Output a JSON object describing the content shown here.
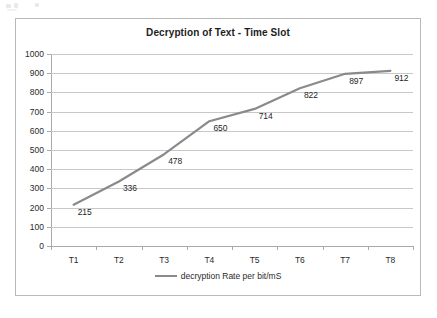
{
  "chart_data": {
    "type": "line",
    "title": "Decryption of Text - Time Slot",
    "xlabel": "",
    "ylabel": "",
    "categories": [
      "T1",
      "T2",
      "T3",
      "T4",
      "T5",
      "T6",
      "T7",
      "T8"
    ],
    "series": [
      {
        "name": "decryption Rate per bit/mS",
        "values": [
          215,
          336,
          478,
          650,
          714,
          822,
          897,
          912
        ]
      }
    ],
    "data_labels": [
      "215",
      "336",
      "478",
      "650",
      "714",
      "822",
      "897",
      "912"
    ],
    "ylim": [
      0,
      1000
    ],
    "y_ticks": [
      0,
      100,
      200,
      300,
      400,
      500,
      600,
      700,
      800,
      900,
      1000
    ],
    "y_tick_labels": [
      "0",
      "100",
      "200",
      "300",
      "400",
      "500",
      "600",
      "700",
      "800",
      "900",
      "1000"
    ],
    "grid": true,
    "legend_position": "bottom",
    "legend_entries": [
      "decryption Rate per bit/mS"
    ],
    "colors": {
      "series_line": "#8a8a8a",
      "gridline": "#c8c8c8",
      "axis": "#a9a9a9",
      "text": "#2b2b2b",
      "title": "#1d1d1d",
      "plot_background": "#ffffff",
      "frame_border": "#b9b9b9"
    }
  }
}
